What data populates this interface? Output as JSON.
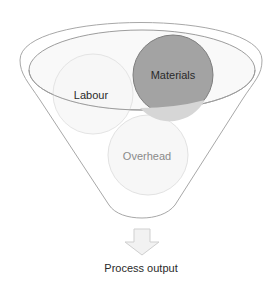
{
  "diagram": {
    "type": "funnel",
    "inputs": [
      {
        "label": "Labour",
        "style": "faint"
      },
      {
        "label": "Materials",
        "style": "highlighted"
      },
      {
        "label": "Overhead",
        "style": "faint"
      }
    ],
    "output": {
      "label": "Process output",
      "icon": "down-arrow-icon"
    }
  },
  "colors": {
    "funnel_stroke": "#a8a8a8",
    "materials_fill": "#a3a3a3",
    "materials_stroke": "#7d7d7d",
    "faint_circle_fill": "#f7f7f7",
    "faint_circle_stroke": "#e2e2e2",
    "arrow_fill": "#f2f2f2",
    "arrow_stroke": "#cfcfcf"
  }
}
